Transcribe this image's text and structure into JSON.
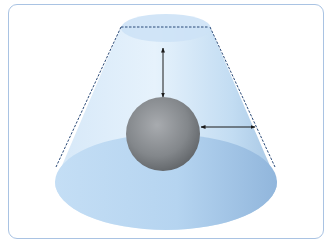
{
  "diagram": {
    "title": "",
    "colors": {
      "frame_border": "#a9c3e3",
      "frustum_fill_light": "#e3f0fb",
      "frustum_fill_mid": "#c7e0f5",
      "frustum_fill_dark": "#9cc0e2",
      "top_face": "#cfe3f6",
      "bottom_face": "#b9d8f2",
      "edge_dashed": "#2a4a78",
      "sphere_light": "#a6a9ad",
      "sphere_dark": "#5e6266",
      "arrow": "#1b1b1b"
    },
    "shapes": {
      "frustum": {
        "top_ellipse": {
          "cx": 166,
          "cy": 28,
          "rx": 45,
          "ry": 14
        },
        "bottom_ellipse": {
          "cx": 166,
          "cy": 182,
          "rx": 111,
          "ry": 48
        },
        "left_edge": {
          "x1": 121,
          "y1": 27,
          "x2": 56,
          "y2": 167
        },
        "right_edge": {
          "x1": 210,
          "y1": 27,
          "x2": 275,
          "y2": 167
        },
        "top_dashed_chord": {
          "x1": 121,
          "y1": 27,
          "x2": 209,
          "y2": 27
        }
      },
      "sphere": {
        "cx": 163,
        "cy": 134,
        "r": 37
      },
      "arrows": [
        {
          "name": "vertical-distance-arrow",
          "x1": 163,
          "y1": 48,
          "x2": 163,
          "y2": 97
        },
        {
          "name": "horizontal-distance-arrow",
          "x1": 201,
          "y1": 127,
          "x2": 255,
          "y2": 127
        }
      ]
    },
    "labels": []
  }
}
